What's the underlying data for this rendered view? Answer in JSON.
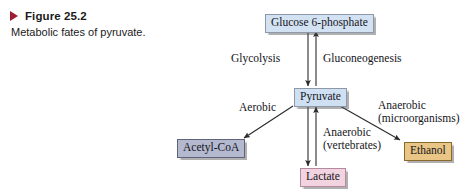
{
  "caption": {
    "marker_icon": "right-triangle-icon",
    "title": "Figure 25.2",
    "subtitle": "Metabolic fates of pyruvate."
  },
  "diagram": {
    "title": "Metabolic fates of pyruvate",
    "nodes": [
      {
        "id": "g6p",
        "label": "Glucose 6-phosphate",
        "color": "#d3e2f2"
      },
      {
        "id": "pyruvate",
        "label": "Pyruvate",
        "color": "#cfe0f2"
      },
      {
        "id": "acetylcoa",
        "label": "Acetyl-CoA",
        "color": "#b4b9cf"
      },
      {
        "id": "lactate",
        "label": "Lactate",
        "color": "#f2d3e0"
      },
      {
        "id": "ethanol",
        "label": "Ethanol",
        "color": "#e9c586"
      }
    ],
    "edge_labels": {
      "glycolysis": "Glycolysis",
      "gluconeogenesis": "Gluconeogenesis",
      "aerobic": "Aerobic",
      "anaerobic_micro_line1": "Anaerobic",
      "anaerobic_micro_line2": "(microorganisms)",
      "anaerobic_vert_line1": "Anaerobic",
      "anaerobic_vert_line2": "(vertebrates)"
    },
    "arrow_color": "#2b2b2f"
  }
}
